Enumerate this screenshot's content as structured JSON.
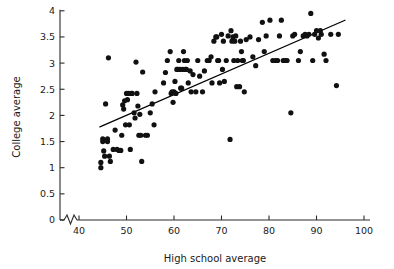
{
  "chart_data": {
    "type": "scatter",
    "title": "",
    "xlabel": "High school average",
    "ylabel": "College average",
    "xlim": [
      37,
      100
    ],
    "ylim": [
      0,
      4
    ],
    "grid": false,
    "legend": "none",
    "axis_break": {
      "axis": "x",
      "note": "zigzag break between 0 and 40 near origin"
    },
    "xticks": [
      40,
      50,
      60,
      70,
      80,
      90,
      100
    ],
    "xtick_labels": [
      "40",
      "50",
      "60",
      "70",
      "80",
      "90",
      "100"
    ],
    "yticks": [
      0,
      0.5,
      1,
      1.5,
      2,
      2.5,
      3,
      3.5,
      4
    ],
    "ytick_labels": [
      "0",
      "0.5",
      "1",
      "1.5",
      "2",
      "2.5",
      "3",
      "3.5",
      "4"
    ],
    "marker": "filled-circle",
    "marker_color": "#111111",
    "marker_size": 2.6,
    "n_points": 142,
    "trend_line": {
      "type": "linear-fit",
      "color": "#000000",
      "x_start": 44.4,
      "y_start": 1.78,
      "x_end": 96.0,
      "y_end": 3.82
    },
    "points": [
      [
        44.6,
        1.1
      ],
      [
        44.6,
        1.0
      ],
      [
        45.0,
        1.55
      ],
      [
        45.0,
        1.5
      ],
      [
        45.2,
        1.32
      ],
      [
        45.4,
        1.22
      ],
      [
        45.6,
        2.22
      ],
      [
        46.0,
        1.55
      ],
      [
        46.0,
        1.5
      ],
      [
        46.2,
        3.1
      ],
      [
        46.4,
        1.22
      ],
      [
        46.6,
        1.12
      ],
      [
        47.2,
        1.35
      ],
      [
        47.6,
        1.72
      ],
      [
        48.0,
        1.35
      ],
      [
        48.4,
        1.33
      ],
      [
        48.8,
        1.33
      ],
      [
        49.0,
        1.62
      ],
      [
        49.2,
        2.2
      ],
      [
        49.4,
        2.12
      ],
      [
        49.6,
        2.28
      ],
      [
        49.8,
        1.82
      ],
      [
        50.0,
        2.42
      ],
      [
        50.2,
        2.3
      ],
      [
        50.4,
        2.42
      ],
      [
        50.6,
        1.82
      ],
      [
        50.8,
        1.35
      ],
      [
        51.0,
        2.42
      ],
      [
        51.2,
        2.42
      ],
      [
        51.6,
        2.05
      ],
      [
        51.8,
        1.95
      ],
      [
        52.0,
        3.02
      ],
      [
        52.2,
        2.42
      ],
      [
        52.4,
        2.18
      ],
      [
        52.6,
        1.62
      ],
      [
        52.8,
        2.02
      ],
      [
        53.0,
        1.62
      ],
      [
        53.2,
        1.12
      ],
      [
        53.4,
        2.83
      ],
      [
        54.0,
        1.62
      ],
      [
        54.4,
        1.62
      ],
      [
        55.0,
        2.05
      ],
      [
        55.4,
        2.22
      ],
      [
        55.8,
        1.82
      ],
      [
        56.0,
        2.45
      ],
      [
        57.8,
        2.62
      ],
      [
        58.2,
        2.82
      ],
      [
        58.6,
        3.05
      ],
      [
        59.2,
        3.22
      ],
      [
        59.4,
        2.42
      ],
      [
        59.6,
        2.45
      ],
      [
        59.8,
        2.25
      ],
      [
        60.0,
        2.45
      ],
      [
        60.2,
        2.65
      ],
      [
        60.4,
        2.42
      ],
      [
        60.6,
        2.88
      ],
      [
        60.8,
        2.88
      ],
      [
        61.0,
        3.05
      ],
      [
        61.2,
        2.88
      ],
      [
        61.4,
        2.52
      ],
      [
        61.6,
        2.52
      ],
      [
        61.8,
        2.88
      ],
      [
        62.0,
        3.22
      ],
      [
        62.2,
        3.05
      ],
      [
        62.4,
        2.88
      ],
      [
        62.6,
        2.88
      ],
      [
        62.8,
        3.05
      ],
      [
        63.0,
        2.62
      ],
      [
        63.4,
        2.85
      ],
      [
        63.6,
        2.45
      ],
      [
        64.0,
        2.78
      ],
      [
        64.6,
        2.45
      ],
      [
        65.0,
        3.05
      ],
      [
        65.4,
        2.75
      ],
      [
        66.0,
        2.45
      ],
      [
        66.4,
        2.85
      ],
      [
        67.0,
        3.05
      ],
      [
        67.4,
        3.05
      ],
      [
        67.8,
        3.12
      ],
      [
        68.0,
        2.62
      ],
      [
        68.4,
        3.42
      ],
      [
        68.8,
        3.5
      ],
      [
        69.0,
        3.5
      ],
      [
        69.2,
        3.05
      ],
      [
        69.4,
        3.05
      ],
      [
        69.6,
        2.62
      ],
      [
        70.0,
        3.55
      ],
      [
        70.2,
        2.88
      ],
      [
        70.4,
        3.42
      ],
      [
        70.6,
        2.65
      ],
      [
        71.0,
        3.05
      ],
      [
        71.4,
        3.52
      ],
      [
        71.8,
        1.54
      ],
      [
        72.0,
        3.62
      ],
      [
        72.2,
        3.42
      ],
      [
        72.4,
        3.5
      ],
      [
        72.6,
        3.05
      ],
      [
        72.8,
        3.42
      ],
      [
        73.0,
        3.52
      ],
      [
        73.2,
        2.55
      ],
      [
        73.4,
        3.05
      ],
      [
        73.8,
        2.55
      ],
      [
        74.0,
        3.42
      ],
      [
        74.2,
        3.22
      ],
      [
        74.4,
        3.05
      ],
      [
        74.6,
        3.05
      ],
      [
        74.8,
        2.45
      ],
      [
        75.2,
        3.45
      ],
      [
        76.0,
        3.5
      ],
      [
        76.6,
        3.12
      ],
      [
        77.2,
        2.95
      ],
      [
        77.8,
        3.45
      ],
      [
        78.6,
        3.78
      ],
      [
        79.0,
        3.22
      ],
      [
        79.4,
        3.52
      ],
      [
        80.2,
        3.82
      ],
      [
        80.8,
        3.05
      ],
      [
        81.4,
        3.05
      ],
      [
        81.8,
        3.05
      ],
      [
        82.2,
        3.52
      ],
      [
        82.6,
        3.82
      ],
      [
        83.0,
        3.05
      ],
      [
        83.4,
        3.05
      ],
      [
        83.8,
        3.05
      ],
      [
        84.6,
        2.05
      ],
      [
        85.0,
        3.52
      ],
      [
        85.4,
        3.55
      ],
      [
        86.2,
        3.05
      ],
      [
        86.6,
        3.22
      ],
      [
        87.2,
        3.52
      ],
      [
        87.6,
        3.55
      ],
      [
        88.0,
        3.52
      ],
      [
        88.4,
        3.55
      ],
      [
        88.8,
        3.95
      ],
      [
        89.2,
        3.05
      ],
      [
        89.6,
        3.55
      ],
      [
        90.0,
        3.62
      ],
      [
        90.4,
        3.48
      ],
      [
        90.8,
        3.62
      ],
      [
        91.0,
        3.55
      ],
      [
        91.6,
        3.17
      ],
      [
        92.0,
        3.05
      ],
      [
        93.0,
        3.55
      ],
      [
        94.2,
        2.57
      ],
      [
        94.6,
        3.55
      ]
    ]
  }
}
